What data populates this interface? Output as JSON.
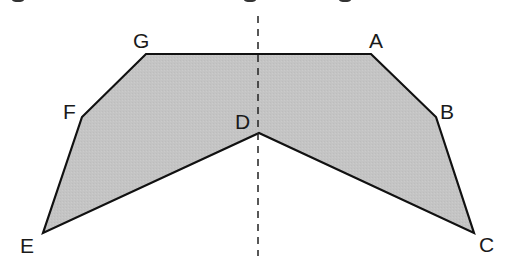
{
  "diagram": {
    "type": "polygon-with-axis-of-symmetry",
    "fill_color": "#c4c4c4",
    "stroke_color": "#111111",
    "axis": {
      "style": "dashed",
      "x": 258,
      "y1": 16,
      "y2": 256,
      "color": "#222222"
    },
    "vertices": [
      {
        "label": "A",
        "x": 371,
        "y": 54,
        "label_x": 369,
        "label_y": 48
      },
      {
        "label": "B",
        "x": 436,
        "y": 117,
        "label_x": 440,
        "label_y": 119
      },
      {
        "label": "C",
        "x": 474,
        "y": 233,
        "label_x": 479,
        "label_y": 252
      },
      {
        "label": "D",
        "x": 259,
        "y": 133,
        "label_x": 235,
        "label_y": 129
      },
      {
        "label": "E",
        "x": 43,
        "y": 233,
        "label_x": 20,
        "label_y": 253
      },
      {
        "label": "F",
        "x": 82,
        "y": 117,
        "label_x": 63,
        "label_y": 119
      },
      {
        "label": "G",
        "x": 146,
        "y": 54,
        "label_x": 133,
        "label_y": 48
      }
    ]
  }
}
